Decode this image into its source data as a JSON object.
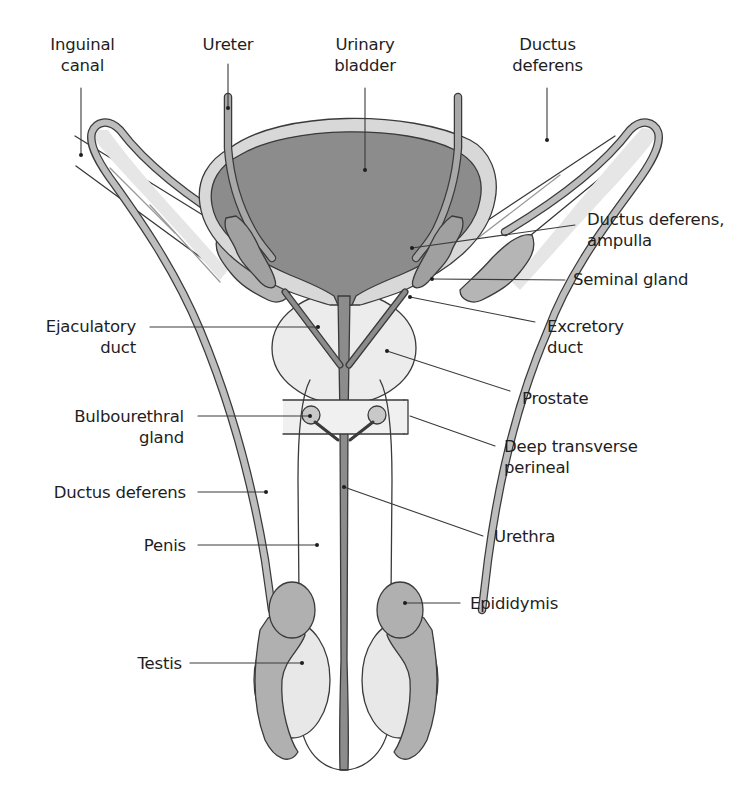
{
  "figure": {
    "colors": {
      "bladder_dark": "#8c8c8c",
      "duct_mid": "#adadad",
      "organ_light": "#ececec",
      "outline": "#3a3a3a",
      "leader": "#3a3a3a",
      "text": "#1e1e1e",
      "background": "#ffffff"
    }
  },
  "labels": {
    "inguinal_canal": {
      "line1": "Inguinal",
      "line2": "canal"
    },
    "ureter": {
      "line1": "Ureter"
    },
    "urinary_bladder": {
      "line1": "Urinary",
      "line2": "bladder"
    },
    "ductus_deferens_top": {
      "line1": "Ductus",
      "line2": "deferens"
    },
    "ductus_deferens_ampulla": {
      "line1": "Ductus deferens,",
      "line2": "ampulla"
    },
    "seminal_gland": {
      "line1": "Seminal gland"
    },
    "ejaculatory_duct": {
      "line1": "Ejaculatory",
      "line2": "duct"
    },
    "excretory_duct": {
      "line1": "Excretory",
      "line2": "duct"
    },
    "prostate": {
      "line1": "Prostate"
    },
    "bulbourethral_gland": {
      "line1": "Bulbourethral",
      "line2": "gland"
    },
    "deep_transverse_perineal": {
      "line1": "Deep transverse",
      "line2": "perineal"
    },
    "ductus_deferens_side": {
      "line1": "Ductus deferens"
    },
    "penis": {
      "line1": "Penis"
    },
    "urethra": {
      "line1": "Urethra"
    },
    "epididymis": {
      "line1": "Epididymis"
    },
    "testis": {
      "line1": "Testis"
    }
  }
}
